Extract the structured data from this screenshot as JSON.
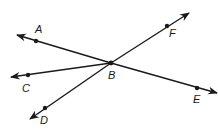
{
  "diagram": {
    "vertex": {
      "label": "B",
      "x": 111,
      "y": 63,
      "label_x": 108,
      "label_y": 79
    },
    "rays": [
      {
        "label": "A",
        "point": [
          36,
          41
        ],
        "tip": [
          17,
          35
        ],
        "label_x": 35,
        "label_y": 33
      },
      {
        "label": "C",
        "point": [
          28,
          75
        ],
        "tip": [
          11,
          77
        ],
        "label_x": 22,
        "label_y": 92
      },
      {
        "label": "D",
        "point": [
          45,
          108
        ],
        "tip": [
          30,
          119
        ],
        "label_x": 40,
        "label_y": 124
      },
      {
        "label": "F",
        "point": [
          167,
          26
        ],
        "tip": [
          189,
          13
        ],
        "label_x": 169,
        "label_y": 37
      },
      {
        "label": "E",
        "point": [
          197,
          88
        ],
        "tip": [
          217,
          93
        ],
        "label_x": 193,
        "label_y": 103
      }
    ],
    "stroke_color": "#1a1a1a"
  }
}
